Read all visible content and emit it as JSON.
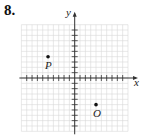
{
  "problem": {
    "number": "8."
  },
  "axes": {
    "x_label": "x",
    "y_label": "y"
  },
  "colors": {
    "grid": "#d9d9d9",
    "axis": "#333333",
    "point": "#111111"
  },
  "grid": {
    "origin_px": [
      74.7,
      78
    ],
    "unit_px": 5.33,
    "x_range": [
      -10,
      10
    ],
    "y_range": [
      -10,
      10
    ]
  },
  "points": [
    {
      "label": "P",
      "x": -5,
      "y": 4
    },
    {
      "label": "O",
      "x": 4,
      "y": -5
    }
  ],
  "chart_data": {
    "type": "scatter",
    "title": "8.",
    "xlabel": "x",
    "ylabel": "y",
    "xlim": [
      -10,
      10
    ],
    "ylim": [
      -10,
      10
    ],
    "grid": true,
    "points": [
      {
        "label": "P",
        "x": -5,
        "y": 4
      },
      {
        "label": "O",
        "x": 4,
        "y": -5
      }
    ]
  }
}
